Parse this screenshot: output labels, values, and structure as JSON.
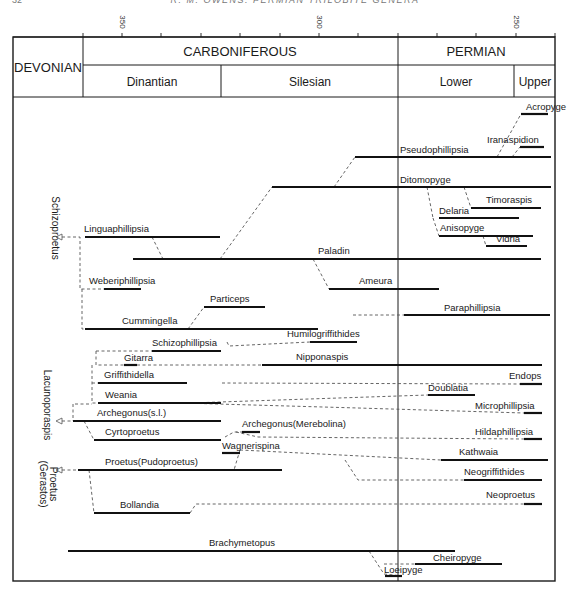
{
  "page_header": {
    "page_number": "32",
    "running_title": "R. M. OWENS: PERMIAN TRILOBITE GENERA"
  },
  "axis": {
    "unit": "Ma",
    "ticks": [
      {
        "x": 83,
        "label": ""
      },
      {
        "x": 122,
        "label": "350"
      },
      {
        "x": 161,
        "label": ""
      },
      {
        "x": 201,
        "label": ""
      },
      {
        "x": 240,
        "label": ""
      },
      {
        "x": 280,
        "label": ""
      },
      {
        "x": 319,
        "label": "300"
      },
      {
        "x": 358,
        "label": ""
      },
      {
        "x": 398,
        "label": ""
      },
      {
        "x": 437,
        "label": ""
      },
      {
        "x": 476,
        "label": ""
      },
      {
        "x": 516,
        "label": "250"
      },
      {
        "x": 555,
        "label": ""
      }
    ]
  },
  "periods": {
    "devonian": "DEVONIAN",
    "carboniferous": "CARBONIFEROUS",
    "permian": "PERMIAN",
    "dinantian": "Dinantian",
    "silesian": "Silesian",
    "lower": "Lower",
    "upper": "Upper"
  },
  "groups": [
    {
      "label": "Schizoproetus",
      "x": 52,
      "y": 228
    },
    {
      "label": "Lacunoporaspis",
      "x": 44,
      "y": 405
    },
    {
      "label": "Proetus",
      "x": 50,
      "y": 484
    },
    {
      "label": "(Gerastos)",
      "x": 40,
      "y": 484
    }
  ],
  "chart_data": {
    "type": "range-chart",
    "x_axis": {
      "label": "Ma",
      "ticks": [
        350,
        300,
        250
      ],
      "range": [
        360,
        240
      ]
    },
    "intervals": [
      {
        "name": "DEVONIAN",
        "level": "period"
      },
      {
        "name": "CARBONIFEROUS",
        "level": "period",
        "subdivisions": [
          "Dinantian",
          "Silesian"
        ]
      },
      {
        "name": "PERMIAN",
        "level": "period",
        "subdivisions": [
          "Lower",
          "Upper"
        ]
      }
    ],
    "genera": [
      {
        "name": "Acropyge",
        "x1": 521,
        "x2": 548,
        "y": 114,
        "lx": 526,
        "ly": 110
      },
      {
        "name": "Iranaspidion",
        "x1": 520,
        "x2": 544,
        "y": 147,
        "lx": 487,
        "ly": 143
      },
      {
        "name": "Pseudophillipsia",
        "x1": 355,
        "x2": 551,
        "y": 157,
        "lx": 400,
        "ly": 153
      },
      {
        "name": "Ditomopyge",
        "x1": 272,
        "x2": 551,
        "y": 187,
        "lx": 400,
        "ly": 183
      },
      {
        "name": "Timoraspis",
        "x1": 471,
        "x2": 541,
        "y": 208,
        "lx": 486,
        "ly": 203
      },
      {
        "name": "Delaria",
        "x1": 439,
        "x2": 519,
        "y": 218,
        "lx": 439,
        "ly": 214
      },
      {
        "name": "Anisopyge",
        "x1": 439,
        "x2": 533,
        "y": 236,
        "lx": 440,
        "ly": 231
      },
      {
        "name": "Vidria",
        "x1": 486,
        "x2": 527,
        "y": 246,
        "lx": 496,
        "ly": 242
      },
      {
        "name": "Linguaphillipsia",
        "x1": 85,
        "x2": 220,
        "y": 237,
        "lx": 84,
        "ly": 232
      },
      {
        "name": "Paladin",
        "x1": 133,
        "x2": 541,
        "y": 259,
        "lx": 318,
        "ly": 254
      },
      {
        "name": "Weberiphillipsia",
        "x1": 104,
        "x2": 141,
        "y": 289,
        "lx": 89,
        "ly": 284
      },
      {
        "name": "Ameura",
        "x1": 329,
        "x2": 439,
        "y": 289,
        "lx": 359,
        "ly": 284
      },
      {
        "name": "Particeps",
        "x1": 204,
        "x2": 265,
        "y": 307,
        "lx": 210,
        "ly": 302
      },
      {
        "name": "Paraphillipsia",
        "x1": 404,
        "x2": 550,
        "y": 315,
        "lx": 444,
        "ly": 311
      },
      {
        "name": "Cummingella",
        "x1": 85,
        "x2": 318,
        "y": 329,
        "lx": 122,
        "ly": 324
      },
      {
        "name": "Humilogriffithides",
        "x1": 310,
        "x2": 357,
        "y": 342,
        "lx": 287,
        "ly": 337
      },
      {
        "name": "Schizophillipsia",
        "x1": 152,
        "x2": 221,
        "y": 351,
        "lx": 152,
        "ly": 346
      },
      {
        "name": "Nipponaspis",
        "x1": 262,
        "x2": 542,
        "y": 365,
        "lx": 296,
        "ly": 360
      },
      {
        "name": "Gitarra",
        "x1": 124,
        "x2": 137,
        "y": 365,
        "lx": 124,
        "ly": 361
      },
      {
        "name": "Endops",
        "x1": 520,
        "x2": 542,
        "y": 384,
        "lx": 509,
        "ly": 379
      },
      {
        "name": "Griffithidella",
        "x1": 98,
        "x2": 187,
        "y": 383,
        "lx": 104,
        "ly": 378
      },
      {
        "name": "Doublatia",
        "x1": 428,
        "x2": 475,
        "y": 395,
        "lx": 428,
        "ly": 391
      },
      {
        "name": "Weania",
        "x1": 98,
        "x2": 221,
        "y": 403,
        "lx": 105,
        "ly": 398
      },
      {
        "name": "Microphillipsia",
        "x1": 524,
        "x2": 542,
        "y": 413,
        "lx": 475,
        "ly": 409
      },
      {
        "name": "Archegonus(s.l.)",
        "x1": 73,
        "x2": 221,
        "y": 421,
        "lx": 97,
        "ly": 416
      },
      {
        "name": "Archegonus(Merebolina)",
        "x1": 242,
        "x2": 260,
        "y": 432,
        "lx": 242,
        "ly": 427
      },
      {
        "name": "Cyrtoproetus",
        "x1": 94,
        "x2": 221,
        "y": 440,
        "lx": 105,
        "ly": 435
      },
      {
        "name": "Hildaphillipsia",
        "x1": 524,
        "x2": 542,
        "y": 439,
        "lx": 475,
        "ly": 435
      },
      {
        "name": "Wagnerispina",
        "x1": 222,
        "x2": 240,
        "y": 453,
        "lx": 222,
        "ly": 449
      },
      {
        "name": "Kathwaia",
        "x1": 441,
        "x2": 548,
        "y": 460,
        "lx": 459,
        "ly": 455
      },
      {
        "name": "Proetus(Pudoproetus)",
        "x1": 78,
        "x2": 282,
        "y": 470,
        "lx": 105,
        "ly": 465
      },
      {
        "name": "Neogriffithides",
        "x1": 464,
        "x2": 542,
        "y": 480,
        "lx": 464,
        "ly": 475
      },
      {
        "name": "Neoproetus",
        "x1": 524,
        "x2": 542,
        "y": 504,
        "lx": 486,
        "ly": 498
      },
      {
        "name": "Bollandia",
        "x1": 94,
        "x2": 190,
        "y": 513,
        "lx": 120,
        "ly": 508
      },
      {
        "name": "Brachymetopus",
        "x1": 68,
        "x2": 455,
        "y": 551,
        "lx": 209,
        "ly": 546
      },
      {
        "name": "Cheiropyge",
        "x1": 415,
        "x2": 502,
        "y": 564,
        "lx": 433,
        "ly": 561
      },
      {
        "name": "Loeipyge",
        "x1": 385,
        "x2": 402,
        "y": 576,
        "lx": 384,
        "ly": 573
      }
    ],
    "dashed_links": [
      {
        "d": "M497,157 L521,114"
      },
      {
        "d": "M512,157 L520,147"
      },
      {
        "d": "M334,187 L355,157"
      },
      {
        "d": "M427,187 L433,218"
      },
      {
        "d": "M433,218 L439,236"
      },
      {
        "d": "M464,187 L471,208"
      },
      {
        "d": "M483,236 L486,246"
      },
      {
        "d": "M220,259 L272,187"
      },
      {
        "d": "M152,237 L163,259"
      },
      {
        "d": "M313,259 L329,289"
      },
      {
        "d": "M188,329 L204,307"
      },
      {
        "d": "M62,237 L80,237 L80,289 L104,289"
      },
      {
        "d": "M82,289 L82,329 L85,329"
      },
      {
        "d": "M353,315 L404,315"
      },
      {
        "d": "M227,342 L229,346 L310,342"
      },
      {
        "d": "M96,351 L152,351"
      },
      {
        "d": "M96,351 L96,365 L262,365"
      },
      {
        "d": "M92,365 L92,403 L98,403"
      },
      {
        "d": "M92,383 L98,383"
      },
      {
        "d": "M222,383 L520,384"
      },
      {
        "d": "M190,403 L428,395"
      },
      {
        "d": "M182,403 L358,408 L524,413"
      },
      {
        "d": "M75,404 L92,404"
      },
      {
        "d": "M73,404 L73,421"
      },
      {
        "d": "M84,421 L94,440"
      },
      {
        "d": "M225,437 L234,432 L242,432"
      },
      {
        "d": "M236,432 L258,437 L524,439"
      },
      {
        "d": "M240,450 L234,470"
      },
      {
        "d": "M240,450 L441,460"
      },
      {
        "d": "M345,460 L358,480 L464,480"
      },
      {
        "d": "M89,470 L94,513"
      },
      {
        "d": "M190,513 L196,504 L524,504"
      },
      {
        "d": "M369,551 L384,574 L402,576"
      },
      {
        "d": "M384,564 L415,564"
      },
      {
        "d": "M62,421 L73,421"
      },
      {
        "d": "M62,470 L78,470"
      }
    ]
  }
}
